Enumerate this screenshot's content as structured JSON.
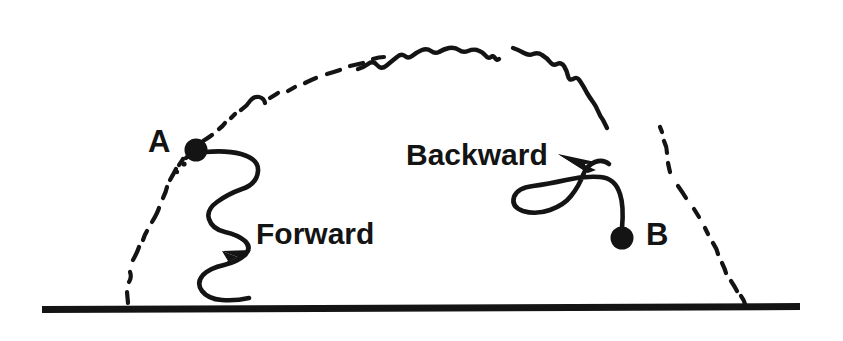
{
  "figure": {
    "type": "technical-line-diagram",
    "background_color": "#ffffff",
    "ink_color": "#141414",
    "width": 843,
    "height": 341
  },
  "baseline": {
    "name": "ground-line",
    "color": "#141414",
    "x_start": 42,
    "x_end": 800,
    "y": 305,
    "thickness": 8
  },
  "arc": {
    "name": "trajectory-arc",
    "style": "wiggly-dashed",
    "color": "#141414",
    "stroke_width": 4,
    "left_foot": [
      128,
      303
    ],
    "apex": [
      430,
      44
    ],
    "right_foot": [
      748,
      303
    ]
  },
  "points": [
    {
      "id": "A",
      "label": "A",
      "label_x": 148,
      "label_y": 126,
      "dot_x": 196,
      "dot_y": 150,
      "dot_radius": 11,
      "color": "#141414"
    },
    {
      "id": "B",
      "label": "B",
      "label_x": 646,
      "label_y": 219,
      "dot_x": 622,
      "dot_y": 238,
      "dot_radius": 11,
      "color": "#141414"
    }
  ],
  "arrows": [
    {
      "id": "forward",
      "label": "Forward",
      "label_x": 256,
      "label_y": 219,
      "font_size": 30,
      "direction": "up-right",
      "style": "serpentine",
      "origin_point": "A",
      "color": "#141414"
    },
    {
      "id": "backward",
      "label": "Backward",
      "label_x": 406,
      "label_y": 140,
      "font_size": 30,
      "direction": "left",
      "style": "serpentine",
      "origin_point": "B",
      "color": "#141414"
    }
  ]
}
